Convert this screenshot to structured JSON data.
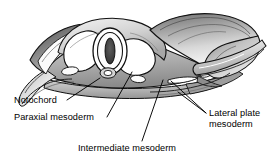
{
  "figure": {
    "name": "embryo-cross-section-mesoderm-diagram",
    "type": "anatomical-line-illustration",
    "style": "grayscale pen-and-ink shaded drawing",
    "background_color": "#ffffff",
    "ink_color": "#000000",
    "shade_colors": [
      "#ffffff",
      "#e8e8e8",
      "#c9c9c9",
      "#a8a8a8",
      "#808080",
      "#585858",
      "#303030"
    ]
  },
  "labels": [
    {
      "id": "notochord",
      "text": "Notochord"
    },
    {
      "id": "paraxial",
      "text": "Paraxial mesoderm"
    },
    {
      "id": "intermediate",
      "text": "Intermediate mesoderm"
    },
    {
      "id": "lateral",
      "text": "Lateral plate\nmesoderm",
      "line1": "Lateral plate",
      "line2": "mesoderm"
    }
  ],
  "structures": [
    {
      "name": "neural-tube",
      "description": "central oval with dark slit lumen"
    },
    {
      "name": "notochord",
      "description": "small round body beneath neural tube"
    },
    {
      "name": "somite-cavity-left",
      "description": "large white ovoid left of neural tube"
    },
    {
      "name": "somite-cavity-right",
      "description": "large white ovoid right of neural tube"
    },
    {
      "name": "ectoderm-sheet",
      "description": "draped wavy sheet over right half"
    },
    {
      "name": "lateral-plate-fold",
      "description": "folded flange at right margin"
    },
    {
      "name": "coelom-spaces",
      "description": "small white lens shapes in lateral mesoderm"
    }
  ]
}
